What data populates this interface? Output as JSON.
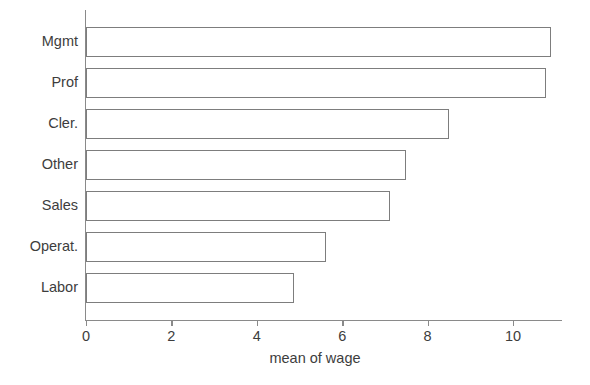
{
  "chart_data": {
    "type": "bar",
    "orientation": "horizontal",
    "title": "",
    "xlabel": "mean of wage",
    "ylabel": "",
    "categories": [
      "Mgmt",
      "Prof",
      "Cler.",
      "Other",
      "Sales",
      "Operat.",
      "Labor"
    ],
    "values": [
      10.9,
      10.77,
      8.5,
      7.5,
      7.12,
      5.62,
      4.87
    ],
    "xlim": [
      0,
      11.15
    ],
    "xticks": [
      0,
      2,
      4,
      6,
      8,
      10
    ],
    "xticklabels": [
      "0",
      "2",
      "4",
      "6",
      "8",
      "10"
    ],
    "grid": false,
    "legend": null,
    "bar_style": {
      "fill": "#ffffff",
      "edge_color": "#7d7d7d",
      "edge_width": 1.4
    },
    "axis_color": "#8a8a8a",
    "text_color": "#3d3d3d",
    "background": "#ffffff"
  }
}
